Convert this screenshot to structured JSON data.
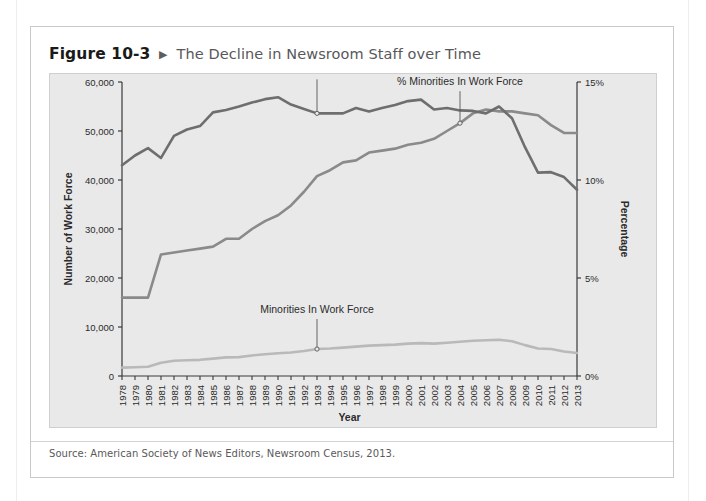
{
  "figure": {
    "number": "Figure 10-3",
    "arrow_icon": "triangle-right-icon",
    "title": "The Decline in Newsroom Staff over Time"
  },
  "source": {
    "text": "Source: American Society of News Editors, Newsroom Census, 2013."
  },
  "colors": {
    "panel_background": "#e9e9e9",
    "total_work_force": "#6e6e6e",
    "pct_minorities": "#8a8a8a",
    "minorities_count": "#b9b9b9",
    "axis": "#3a3a3a",
    "title_gray": "#58585a"
  },
  "chart_data": {
    "type": "line",
    "title": "The Decline in Newsroom Staff over Time",
    "xlabel": "Year",
    "ylabel": "Number of Work Force",
    "y2label": "Percentage",
    "ylim": [
      0,
      60000
    ],
    "y2lim": [
      0,
      15
    ],
    "grid": false,
    "legend_position": "inline-annotations",
    "yticks": [
      "0",
      "10,000",
      "20,000",
      "30,000",
      "40,000",
      "50,000",
      "60,000"
    ],
    "ytick_values": [
      0,
      10000,
      20000,
      30000,
      40000,
      50000,
      60000
    ],
    "y2ticks": [
      "0%",
      "5%",
      "10%",
      "15%"
    ],
    "y2tick_values": [
      0,
      5,
      10,
      15
    ],
    "categories": [
      "1978",
      "1979",
      "1980",
      "1981",
      "1982",
      "1983",
      "1984",
      "1985",
      "1986",
      "1987",
      "1988",
      "1989",
      "1990",
      "1991",
      "1992",
      "1993",
      "1994",
      "1995",
      "1996",
      "1997",
      "1998",
      "1999",
      "2000",
      "2001",
      "2002",
      "2003",
      "2004",
      "2005",
      "2006",
      "2007",
      "2008",
      "2009",
      "2010",
      "2011",
      "2012",
      "2013"
    ],
    "series": [
      {
        "name": "Total Work Force",
        "axis": "left",
        "units": "people",
        "color": "#6e6e6e",
        "label_anchor_year": "1993",
        "values": [
          43000,
          45000,
          46500,
          44500,
          49000,
          50300,
          51000,
          53800,
          54300,
          55000,
          55800,
          56500,
          56900,
          55400,
          54500,
          53600,
          53600,
          53600,
          54700,
          54000,
          54700,
          55300,
          56100,
          56400,
          54400,
          54700,
          54200,
          54100,
          53600,
          55000,
          52600,
          46700,
          41500,
          41600,
          40600,
          38000
        ]
      },
      {
        "name": "% Minorities In Work Force",
        "axis": "right",
        "units": "percent",
        "color": "#8a8a8a",
        "label_anchor_year": "2004",
        "values": [
          4.0,
          4.0,
          4.0,
          6.2,
          6.3,
          6.4,
          6.5,
          6.6,
          7.0,
          7.0,
          7.5,
          7.9,
          8.2,
          8.7,
          9.4,
          10.2,
          10.5,
          10.9,
          11.0,
          11.4,
          11.5,
          11.6,
          11.8,
          11.9,
          12.1,
          12.5,
          12.9,
          13.4,
          13.6,
          13.5,
          13.5,
          13.4,
          13.3,
          12.8,
          12.4,
          12.4
        ]
      },
      {
        "name": "Minorities In Work Force",
        "axis": "left",
        "units": "people",
        "color": "#b9b9b9",
        "label_anchor_year": "1993",
        "values": [
          1700,
          1800,
          1900,
          2700,
          3100,
          3200,
          3300,
          3550,
          3800,
          3850,
          4200,
          4450,
          4650,
          4800,
          5100,
          5500,
          5600,
          5800,
          6000,
          6200,
          6300,
          6400,
          6600,
          6700,
          6600,
          6800,
          7000,
          7200,
          7300,
          7400,
          7100,
          6300,
          5600,
          5500,
          5000,
          4700
        ]
      }
    ],
    "annotations": [
      {
        "text": "Total Work Force",
        "series": "Total Work Force",
        "at_year": "1993"
      },
      {
        "text": "% Minorities In Work Force",
        "series": "% Minorities In Work Force",
        "at_year": "2004"
      },
      {
        "text": "Minorities In Work Force",
        "series": "Minorities In Work Force",
        "at_year": "1993"
      }
    ]
  }
}
